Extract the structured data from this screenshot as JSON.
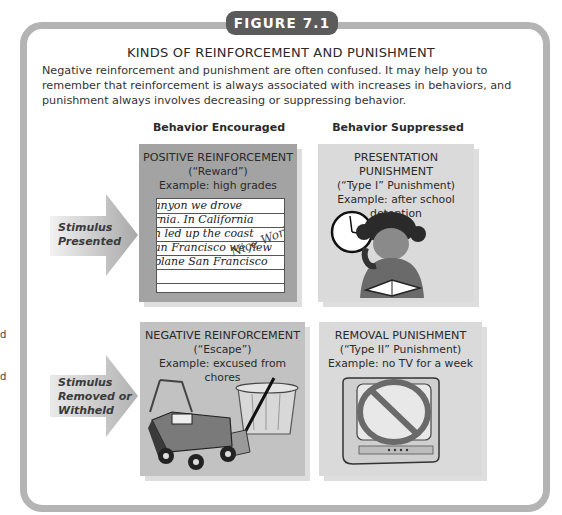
{
  "figure": {
    "badge": "FIGURE 7.1",
    "title": "KINDS OF REINFORCEMENT AND PUNISHMENT",
    "intro": "Negative reinforcement and punishment are often confused. It may help you to remember that reinforcement is always associated with increases in behaviors, and punishment always involves decreasing or suppressing behavior."
  },
  "margin_fragments": [
    "d",
    "d"
  ],
  "columns": {
    "encouraged": "Behavior Encouraged",
    "suppressed": "Behavior Suppressed"
  },
  "rows": {
    "presented": {
      "label_line1": "Stimulus",
      "label_line2": "Presented"
    },
    "removed": {
      "label_line1": "Stimulus",
      "label_line2": "Removed or",
      "label_line3": "Withheld"
    }
  },
  "cells": {
    "positive_reinforcement": {
      "heading": "POSITIVE REINFORCEMENT",
      "alias": "(“Reward”)",
      "example": "Example: high grades",
      "illustration": "handwritten-paper",
      "handwriting": [
        "anyon we drove",
        "rnia. In California",
        "h led up the coast",
        "an Francisco we flew",
        "plane San Francisco"
      ],
      "annotation": "Nice Work!"
    },
    "presentation_punishment": {
      "heading": "PRESENTATION PUNISHMENT",
      "alias": "(“Type I” Punishment)",
      "example": "Example: after school detention",
      "illustration": "girl-studying-with-clock"
    },
    "negative_reinforcement": {
      "heading": "NEGATIVE REINFORCEMENT",
      "alias": "(“Escape”)",
      "example": "Example: excused from chores",
      "illustration": "lawnmower-trashcan-rake"
    },
    "removal_punishment": {
      "heading": "REMOVAL PUNISHMENT",
      "alias": "(“Type II” Punishment)",
      "example": "Example: no TV for a week",
      "illustration": "tv-with-prohibition-sign"
    }
  },
  "colors": {
    "frame": "#b4b4b4",
    "badge": "#5b5b5b",
    "positive_box": "#a3a3a3",
    "negative_box": "#c2c2c2",
    "punishment_box": "#dadada"
  }
}
